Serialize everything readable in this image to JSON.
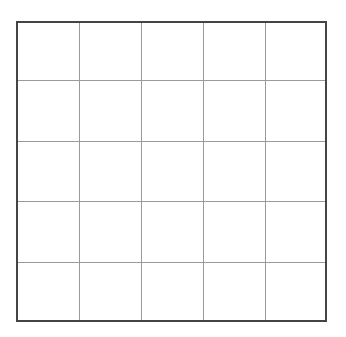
{
  "grid": {
    "rows": 5,
    "cols": 5,
    "border_color": "#444444",
    "line_color": "#9a9a9a",
    "vlines_px": [
      61,
      123,
      185,
      247
    ],
    "hlines_px": [
      57,
      118,
      178,
      239
    ]
  }
}
